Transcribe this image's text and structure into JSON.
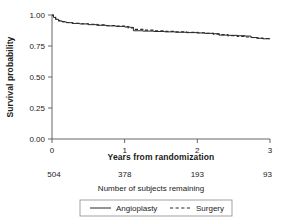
{
  "chart_data": {
    "type": "line",
    "title": "",
    "xlabel": "Years from randomization",
    "ylabel": "Survival probability",
    "xlim": [
      0,
      3
    ],
    "ylim": [
      0,
      1
    ],
    "xticks": [
      0,
      1,
      2,
      3
    ],
    "xticklabels": [
      "0",
      "1",
      "2",
      "3"
    ],
    "yticks": [
      0.0,
      0.25,
      0.5,
      0.75,
      1.0
    ],
    "yticklabels": [
      "0.00",
      "0.25",
      "0.50",
      "0.75",
      "1.00"
    ],
    "grid": false,
    "legend_position": "bottom",
    "step_style": "post",
    "series": [
      {
        "name": "Angioplasty",
        "style": "solid",
        "color": "#2b2b2b",
        "x": [
          0.0,
          0.02,
          0.05,
          0.09,
          0.14,
          0.2,
          0.28,
          0.38,
          0.5,
          0.62,
          0.75,
          0.88,
          1.0,
          1.08,
          1.12,
          1.25,
          1.4,
          1.55,
          1.7,
          1.85,
          2.0,
          2.1,
          2.22,
          2.3,
          2.42,
          2.55,
          2.66,
          2.74,
          2.82,
          2.9,
          3.0
        ],
        "y": [
          1.0,
          0.98,
          0.965,
          0.952,
          0.944,
          0.938,
          0.932,
          0.928,
          0.922,
          0.917,
          0.912,
          0.908,
          0.903,
          0.9,
          0.873,
          0.87,
          0.867,
          0.864,
          0.861,
          0.858,
          0.855,
          0.852,
          0.849,
          0.838,
          0.836,
          0.833,
          0.83,
          0.818,
          0.812,
          0.808,
          0.806
        ]
      },
      {
        "name": "Surgery",
        "style": "dashed",
        "color": "#2b2b2b",
        "x": [
          0.0,
          0.02,
          0.05,
          0.09,
          0.14,
          0.2,
          0.28,
          0.38,
          0.5,
          0.62,
          0.75,
          0.88,
          1.0,
          1.05,
          1.12,
          1.25,
          1.4,
          1.55,
          1.7,
          1.85,
          2.0,
          2.1,
          2.22,
          2.3,
          2.42,
          2.55,
          2.66,
          2.74,
          2.82,
          2.9,
          3.0
        ],
        "y": [
          1.0,
          0.982,
          0.968,
          0.955,
          0.947,
          0.94,
          0.934,
          0.93,
          0.925,
          0.92,
          0.915,
          0.911,
          0.906,
          0.896,
          0.884,
          0.878,
          0.872,
          0.868,
          0.864,
          0.86,
          0.857,
          0.852,
          0.846,
          0.842,
          0.834,
          0.828,
          0.822,
          0.818,
          0.814,
          0.81,
          0.808
        ]
      }
    ],
    "at_risk": {
      "caption": "Number of subjects remaining",
      "x": [
        0,
        1,
        2,
        3
      ],
      "counts": [
        "504",
        "378",
        "193",
        "93"
      ]
    },
    "legend": [
      {
        "label": "Angioplasty",
        "style": "solid"
      },
      {
        "label": "Surgery",
        "style": "dashed"
      }
    ]
  }
}
